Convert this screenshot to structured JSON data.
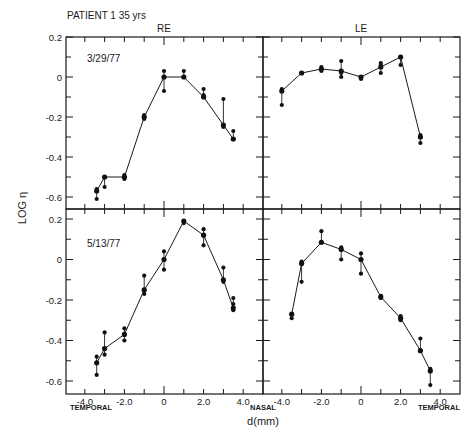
{
  "figure": {
    "title": "PATIENT 1   35 yrs",
    "column_labels": [
      "RE",
      "LE"
    ],
    "y_axis_label": "LOG η",
    "x_axis_label": "d(mm)",
    "x_direction_labels": {
      "left_panel_left": "TEMPORAL",
      "center": "NASAL",
      "right_panel_right": "TEMPORAL"
    },
    "row_dates": [
      "3/29/77",
      "5/13/77"
    ],
    "x_tick_labels": [
      "-4.0",
      "-2.0",
      "0",
      "2.0",
      "4.0"
    ],
    "y_tick_labels": [
      "0.2",
      "0",
      "-0.2",
      "-0.4",
      "-0.6"
    ]
  },
  "chart_data": [
    {
      "type": "line",
      "panel": "top-left",
      "eye": "RE",
      "date": "3/29/77",
      "xlabel": "d(mm)",
      "ylabel": "LOG η",
      "xlim": [
        -5,
        5
      ],
      "ylim": [
        -0.65,
        0.2
      ],
      "x_ticks": [
        -4,
        -2,
        0,
        2,
        4
      ],
      "y_ticks": [
        0.2,
        0,
        -0.2,
        -0.4,
        -0.6
      ],
      "x": [
        -3.4,
        -3.0,
        -2.0,
        -1.0,
        0.0,
        1.0,
        2.0,
        3.0,
        3.5
      ],
      "y": [
        -0.57,
        -0.5,
        -0.5,
        -0.2,
        0.0,
        0.0,
        -0.1,
        -0.24,
        -0.31
      ],
      "extra_points": [
        [
          -3.4,
          -0.56
        ],
        [
          -3.4,
          -0.61
        ],
        [
          -3.0,
          -0.55
        ],
        [
          -2.0,
          -0.49
        ],
        [
          -2.0,
          -0.51
        ],
        [
          -1.0,
          -0.19
        ],
        [
          -1.0,
          -0.21
        ],
        [
          0.0,
          0.03
        ],
        [
          0.0,
          -0.07
        ],
        [
          1.0,
          0.03
        ],
        [
          1.0,
          0.0
        ],
        [
          2.0,
          -0.06
        ],
        [
          2.0,
          -0.09
        ],
        [
          3.0,
          -0.11
        ],
        [
          3.0,
          -0.25
        ],
        [
          3.5,
          -0.27
        ],
        [
          3.5,
          -0.31
        ]
      ]
    },
    {
      "type": "line",
      "panel": "top-right",
      "eye": "LE",
      "date": "3/29/77",
      "xlabel": "d(mm)",
      "ylabel": "LOG η",
      "xlim": [
        -5,
        5
      ],
      "ylim": [
        -0.65,
        0.2
      ],
      "x_ticks": [
        -4,
        -2,
        0,
        2,
        4
      ],
      "y_ticks": [
        0.2,
        0,
        -0.2,
        -0.4,
        -0.6
      ],
      "x": [
        -4.0,
        -3.0,
        -2.0,
        -1.0,
        0.0,
        1.0,
        2.0,
        3.0
      ],
      "y": [
        -0.07,
        0.02,
        0.04,
        0.03,
        0.0,
        0.05,
        0.1,
        -0.3
      ],
      "extra_points": [
        [
          -4.0,
          -0.06
        ],
        [
          -4.0,
          -0.14
        ],
        [
          -3.0,
          0.02
        ],
        [
          -2.0,
          0.05
        ],
        [
          -2.0,
          0.03
        ],
        [
          -1.0,
          0.08
        ],
        [
          -1.0,
          0.02
        ],
        [
          -1.0,
          0.0
        ],
        [
          0.0,
          0.0
        ],
        [
          0.0,
          -0.01
        ],
        [
          1.0,
          0.07
        ],
        [
          1.0,
          0.06
        ],
        [
          1.0,
          0.02
        ],
        [
          2.0,
          0.1
        ],
        [
          2.0,
          0.06
        ],
        [
          3.0,
          -0.29
        ],
        [
          3.0,
          -0.3
        ],
        [
          3.0,
          -0.33
        ]
      ]
    },
    {
      "type": "line",
      "panel": "bottom-left",
      "eye": "RE",
      "date": "5/13/77",
      "xlabel": "d(mm)",
      "ylabel": "LOG η",
      "xlim": [
        -5,
        5
      ],
      "ylim": [
        -0.65,
        0.2
      ],
      "x_ticks": [
        -4,
        -2,
        0,
        2,
        4
      ],
      "y_ticks": [
        0.2,
        0,
        -0.2,
        -0.4,
        -0.6
      ],
      "x": [
        -3.4,
        -3.0,
        -2.0,
        -1.0,
        0.0,
        1.0,
        2.0,
        3.0,
        3.5
      ],
      "y": [
        -0.51,
        -0.44,
        -0.37,
        -0.15,
        0.0,
        0.19,
        0.12,
        -0.1,
        -0.24
      ],
      "extra_points": [
        [
          -3.4,
          -0.48
        ],
        [
          -3.4,
          -0.57
        ],
        [
          -3.0,
          -0.36
        ],
        [
          -3.0,
          -0.47
        ],
        [
          -2.0,
          -0.34
        ],
        [
          -2.0,
          -0.4
        ],
        [
          -1.0,
          -0.08
        ],
        [
          -1.0,
          -0.17
        ],
        [
          0.0,
          0.04
        ],
        [
          0.0,
          -0.05
        ],
        [
          1.0,
          0.18
        ],
        [
          2.0,
          0.15
        ],
        [
          2.0,
          0.07
        ],
        [
          3.0,
          -0.04
        ],
        [
          3.0,
          -0.11
        ],
        [
          3.5,
          -0.19
        ],
        [
          3.5,
          -0.22
        ],
        [
          3.5,
          -0.25
        ]
      ]
    },
    {
      "type": "line",
      "panel": "bottom-right",
      "eye": "LE",
      "date": "5/13/77",
      "xlabel": "d(mm)",
      "ylabel": "LOG η",
      "xlim": [
        -5,
        5
      ],
      "ylim": [
        -0.65,
        0.2
      ],
      "x_ticks": [
        -4,
        -2,
        0,
        2,
        4
      ],
      "y_ticks": [
        0.2,
        0,
        -0.2,
        -0.4,
        -0.6
      ],
      "x": [
        -3.5,
        -3.0,
        -2.0,
        -1.0,
        0.0,
        1.0,
        2.0,
        3.0,
        3.5
      ],
      "y": [
        -0.27,
        -0.02,
        0.085,
        0.05,
        0.0,
        -0.185,
        -0.29,
        -0.45,
        -0.55
      ],
      "extra_points": [
        [
          -3.5,
          -0.29
        ],
        [
          -3.0,
          -0.01
        ],
        [
          -3.0,
          -0.11
        ],
        [
          -2.0,
          0.14
        ],
        [
          -1.0,
          0.06
        ],
        [
          -1.0,
          0.0
        ],
        [
          0.0,
          0.03
        ],
        [
          0.0,
          -0.07
        ],
        [
          1.0,
          -0.18
        ],
        [
          1.0,
          -0.19
        ],
        [
          2.0,
          -0.28
        ],
        [
          2.0,
          -0.3
        ],
        [
          3.0,
          -0.39
        ],
        [
          3.0,
          -0.45
        ],
        [
          3.5,
          -0.54
        ],
        [
          3.5,
          -0.62
        ]
      ]
    }
  ]
}
